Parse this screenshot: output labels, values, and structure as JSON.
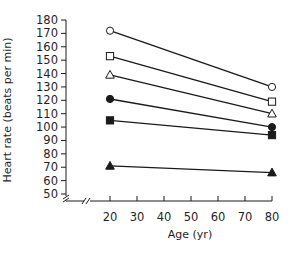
{
  "chart_data": {
    "type": "line",
    "title": "",
    "xlabel": "Age (yr)",
    "ylabel": "Heart rate (beats per min)",
    "x": [
      20,
      80
    ],
    "xticks": [
      20,
      30,
      40,
      50,
      60,
      70,
      80
    ],
    "yticks": [
      50,
      60,
      70,
      80,
      90,
      100,
      110,
      120,
      130,
      140,
      150,
      160,
      170,
      180
    ],
    "xlim": [
      20,
      80
    ],
    "ylim": [
      50,
      180
    ],
    "axis_breaks": {
      "x": true,
      "y": true
    },
    "grid": false,
    "legend": "none",
    "series": [
      {
        "name": "open-circle",
        "marker": "circle",
        "filled": false,
        "values": [
          172,
          130
        ]
      },
      {
        "name": "open-square",
        "marker": "square",
        "filled": false,
        "values": [
          153,
          119
        ]
      },
      {
        "name": "open-triangle",
        "marker": "triangle",
        "filled": false,
        "values": [
          139,
          110
        ]
      },
      {
        "name": "filled-circle",
        "marker": "circle",
        "filled": true,
        "values": [
          121,
          100
        ]
      },
      {
        "name": "filled-square",
        "marker": "square",
        "filled": true,
        "values": [
          105,
          94
        ]
      },
      {
        "name": "filled-triangle",
        "marker": "triangle",
        "filled": true,
        "values": [
          71,
          66
        ]
      }
    ],
    "colors": {
      "line": "#1a1a1a",
      "background": "#ffffff"
    }
  }
}
